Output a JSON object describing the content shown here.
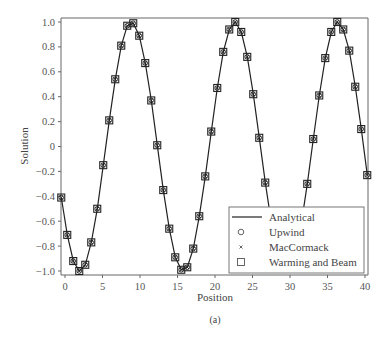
{
  "chart_data": {
    "type": "line",
    "title": "",
    "caption": "(a)",
    "xlabel": "Position",
    "ylabel": "Solution",
    "xlim": [
      -0.6,
      40.4
    ],
    "ylim": [
      -1.03,
      1.03
    ],
    "xticks": [
      0,
      5,
      10,
      15,
      20,
      25,
      30,
      35,
      40
    ],
    "xtick_labels": [
      "0",
      "5",
      "10",
      "15",
      "20",
      "25",
      "30",
      "35",
      "40"
    ],
    "yticks": [
      1.0,
      0.8,
      0.6,
      0.4,
      0.2,
      0,
      -0.2,
      -0.4,
      -0.6,
      -0.8,
      -1.0
    ],
    "ytick_labels": [
      "1.0",
      "0.8",
      "0.6",
      "0.4",
      "0.2",
      "0",
      "−0.2",
      "−0.4",
      "−0.6",
      "−0.8",
      "−1.0"
    ],
    "grid": false,
    "legend_position": "lower right",
    "x": [
      -0.5,
      0.3,
      1.1,
      1.9,
      2.7,
      3.5,
      4.3,
      5.1,
      5.9,
      6.7,
      7.5,
      8.3,
      9.1,
      9.9,
      10.7,
      11.5,
      12.3,
      13.1,
      13.9,
      14.7,
      15.5,
      16.3,
      17.1,
      17.9,
      18.7,
      19.5,
      20.3,
      21.1,
      21.9,
      22.7,
      23.5,
      24.3,
      25.1,
      25.9,
      26.7,
      27.5,
      28.3,
      29.1,
      29.9,
      30.7,
      31.5,
      32.3,
      33.1,
      33.9,
      34.7,
      35.5,
      36.3,
      37.1,
      37.9,
      38.7,
      39.5,
      40.3
    ],
    "series": [
      {
        "name": "Analytical",
        "marker": "line",
        "values": [
          -0.41,
          -0.71,
          -0.92,
          -1.0,
          -0.95,
          -0.77,
          -0.5,
          -0.15,
          0.21,
          0.54,
          0.81,
          0.97,
          0.99,
          0.89,
          0.67,
          0.37,
          0.01,
          -0.35,
          -0.66,
          -0.89,
          -0.99,
          -0.97,
          -0.82,
          -0.56,
          -0.24,
          0.12,
          0.47,
          0.76,
          0.94,
          1.0,
          0.92,
          0.72,
          0.42,
          0.07,
          -0.29,
          -0.61,
          -0.86,
          -0.98,
          -0.98,
          -0.86,
          -0.62,
          -0.3,
          0.06,
          0.41,
          0.71,
          0.92,
          1.0,
          0.94,
          0.77,
          0.48,
          0.14,
          -0.23
        ]
      },
      {
        "name": "Upwind",
        "marker": "circle",
        "values": [
          -0.41,
          -0.71,
          -0.92,
          -1.0,
          -0.95,
          -0.77,
          -0.5,
          -0.15,
          0.21,
          0.54,
          0.81,
          0.97,
          0.99,
          0.89,
          0.67,
          0.37,
          0.01,
          -0.35,
          -0.66,
          -0.89,
          -0.99,
          -0.97,
          -0.82,
          -0.56,
          -0.24,
          0.12,
          0.47,
          0.76,
          0.94,
          1.0,
          0.92,
          0.72,
          0.42,
          0.07,
          -0.29,
          -0.61,
          -0.86,
          -0.98,
          -0.98,
          -0.86,
          -0.62,
          -0.3,
          0.06,
          0.41,
          0.71,
          0.92,
          1.0,
          0.94,
          0.77,
          0.48,
          0.14,
          -0.23
        ]
      },
      {
        "name": "MacCormack",
        "marker": "x",
        "values": [
          -0.41,
          -0.71,
          -0.92,
          -1.0,
          -0.95,
          -0.77,
          -0.5,
          -0.15,
          0.21,
          0.54,
          0.81,
          0.97,
          0.99,
          0.89,
          0.67,
          0.37,
          0.01,
          -0.35,
          -0.66,
          -0.89,
          -0.99,
          -0.97,
          -0.82,
          -0.56,
          -0.24,
          0.12,
          0.47,
          0.76,
          0.94,
          1.0,
          0.92,
          0.72,
          0.42,
          0.07,
          -0.29,
          -0.61,
          -0.86,
          -0.98,
          -0.98,
          -0.86,
          -0.62,
          -0.3,
          0.06,
          0.41,
          0.71,
          0.92,
          1.0,
          0.94,
          0.77,
          0.48,
          0.14,
          -0.23
        ]
      },
      {
        "name": "Warming and Beam",
        "marker": "square",
        "values": [
          -0.41,
          -0.71,
          -0.92,
          -1.0,
          -0.95,
          -0.77,
          -0.5,
          -0.15,
          0.21,
          0.54,
          0.81,
          0.97,
          0.99,
          0.89,
          0.67,
          0.37,
          0.01,
          -0.35,
          -0.66,
          -0.89,
          -0.99,
          -0.97,
          -0.82,
          -0.56,
          -0.24,
          0.12,
          0.47,
          0.76,
          0.94,
          1.0,
          0.92,
          0.72,
          0.42,
          0.07,
          -0.29,
          -0.61,
          -0.86,
          -0.98,
          -0.98,
          -0.86,
          -0.62,
          -0.3,
          0.06,
          0.41,
          0.71,
          0.92,
          1.0,
          0.94,
          0.77,
          0.48,
          0.14,
          -0.23
        ]
      }
    ]
  },
  "legend": {
    "items": [
      {
        "label": "Analytical",
        "symbol": "line"
      },
      {
        "label": "Upwind",
        "symbol": "circle"
      },
      {
        "label": "MacCormack",
        "symbol": "x"
      },
      {
        "label": "Warming and Beam",
        "symbol": "square"
      }
    ]
  },
  "colors": {
    "line": "#222222",
    "axis": "#666666",
    "text": "#444444"
  }
}
